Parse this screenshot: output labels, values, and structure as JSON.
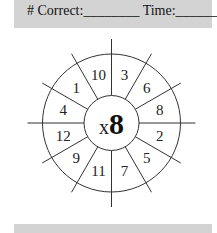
{
  "header": {
    "correct_label": "# Correct:",
    "correct_blank": "________",
    "time_label": "Time:",
    "time_blank": "________"
  },
  "wheel": {
    "operator": "x",
    "multiplier": "8",
    "numbers": [
      "3",
      "6",
      "8",
      "2",
      "5",
      "7",
      "11",
      "9",
      "12",
      "4",
      "1",
      "10"
    ]
  },
  "colors": {
    "band": "#d3d3d3",
    "ink": "#222222"
  }
}
